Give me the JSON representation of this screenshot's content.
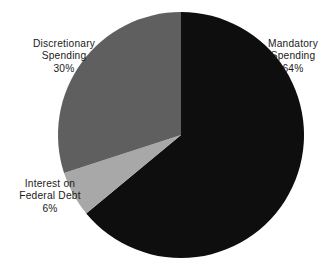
{
  "chart_data": {
    "type": "pie",
    "title": "",
    "subtitle": "",
    "xlabel": "",
    "ylabel": "",
    "legend_position": "none",
    "grid": false,
    "labels_placement": "outside-callout",
    "start_angle_deg": 0,
    "direction": "clockwise",
    "categories": [
      "Mandatory Spending",
      "Interest on Federal Debt",
      "Discretionary Spending"
    ],
    "values": [
      64,
      6,
      30
    ],
    "value_unit": "%",
    "colors": [
      "#0e0e0e",
      "#a8a8a8",
      "#5f5f5f"
    ],
    "slices": [
      {
        "name": "Mandatory Spending",
        "value": 64,
        "value_text": "64%",
        "color": "#0e0e0e",
        "start_angle_deg": 0,
        "end_angle_deg": 230.4
      },
      {
        "name": "Interest on Federal Debt",
        "value": 6,
        "value_text": "6%",
        "color": "#a8a8a8",
        "start_angle_deg": 230.4,
        "end_angle_deg": 252.0
      },
      {
        "name": "Discretionary Spending",
        "value": 30,
        "value_text": "30%",
        "color": "#5f5f5f",
        "start_angle_deg": 252.0,
        "end_angle_deg": 360.0
      }
    ]
  },
  "labels": {
    "mandatory": {
      "line1": "Mandatory",
      "line2": "Spending",
      "line3": "64%"
    },
    "discretionary": {
      "line1": "Discretionary",
      "line2": "Spending",
      "line3": "30%"
    },
    "interest": {
      "line1": "Interest on",
      "line2": "Federal Debt",
      "line3": "6%"
    }
  },
  "geometry": {
    "center_x": 181,
    "center_y": 135,
    "radius": 123,
    "background": "#ffffff"
  }
}
